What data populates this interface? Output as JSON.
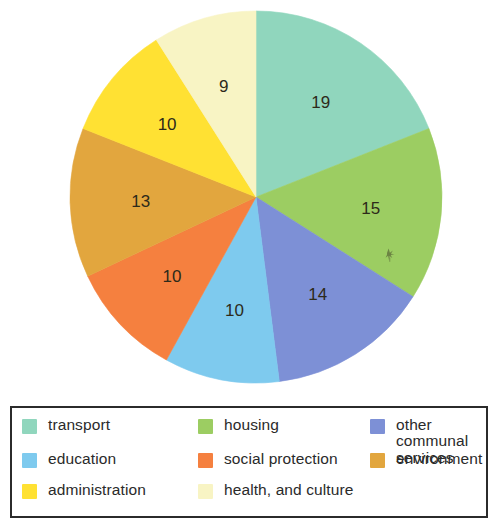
{
  "chart_data": {
    "type": "pie",
    "title": "",
    "legend_position": "bottom",
    "total": 100,
    "units": "percent",
    "start_angle_deg": 0,
    "direction": "clockwise",
    "categories": [
      "transport",
      "housing",
      "other communal services",
      "education",
      "social protection",
      "environment",
      "administration",
      "health, and culture"
    ],
    "values": [
      19,
      15,
      14,
      10,
      10,
      13,
      10,
      9
    ],
    "colors": [
      "#90d6bd",
      "#9ccd62",
      "#7d90d6",
      "#7ecaee",
      "#f5803f",
      "#e2a63e",
      "#ffe133",
      "#f8f4c4"
    ],
    "slices": [
      {
        "label": "transport",
        "value": 19,
        "color": "#90d6bd",
        "data_label": "19"
      },
      {
        "label": "housing",
        "value": 15,
        "color": "#9ccd62",
        "data_label": "15"
      },
      {
        "label": "other communal services",
        "value": 14,
        "color": "#7d90d6",
        "data_label": "14"
      },
      {
        "label": "education",
        "value": 10,
        "color": "#7ecaee",
        "data_label": "10"
      },
      {
        "label": "social protection",
        "value": 10,
        "color": "#f5803f",
        "data_label": "10"
      },
      {
        "label": "environment",
        "value": 13,
        "color": "#e2a63e",
        "data_label": "13"
      },
      {
        "label": "administration",
        "value": 10,
        "color": "#ffe133",
        "data_label": "10"
      },
      {
        "label": "health, and culture",
        "value": 9,
        "color": "#f8f4c4",
        "data_label": "9"
      }
    ]
  },
  "legend": {
    "items": [
      {
        "label": "transport",
        "color": "#90d6bd"
      },
      {
        "label": "housing",
        "color": "#9ccd62"
      },
      {
        "label": "other communal\nservices",
        "color": "#7d90d6"
      },
      {
        "label": "education",
        "color": "#7ecaee"
      },
      {
        "label": "social protection",
        "color": "#f5803f"
      },
      {
        "label": "environment",
        "color": "#e2a63e"
      },
      {
        "label": "administration",
        "color": "#ffe133"
      },
      {
        "label": "health, and culture",
        "color": "#f8f4c4"
      }
    ]
  }
}
